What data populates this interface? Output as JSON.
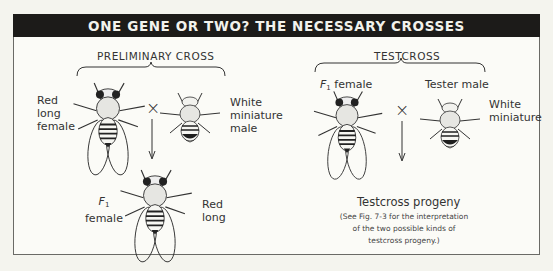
{
  "title": "ONE GENE OR TWO? THE NECESSARY CROSSES",
  "preliminary_cross": {
    "heading": "PRELIMINARY CROSS",
    "parent_female_label": [
      "Red",
      "long",
      "female"
    ],
    "parent_male_label": [
      "White",
      "miniature",
      "male"
    ],
    "cross_symbol": "×",
    "offspring_label_left": {
      "letter": "F",
      "subscript": "1",
      "text": "female"
    },
    "offspring_label_right": [
      "Red",
      "long"
    ]
  },
  "testcross": {
    "heading": "TESTCROSS",
    "female_label": {
      "letter": "F",
      "subscript": "1",
      "text": "female"
    },
    "male_label": "Tester male",
    "male_phenotype": [
      "White",
      "miniature"
    ],
    "cross_symbol": "×",
    "progeny_title": "Testcross progeny",
    "progeny_note": [
      "(See Fig. 7-3 for the interpretation",
      "of the two possible kinds of",
      "testcross progeny.)"
    ]
  }
}
